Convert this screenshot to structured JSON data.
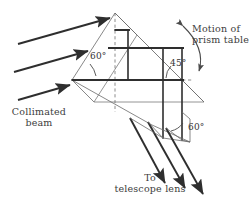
{
  "figure": {
    "type": "optics-diagram",
    "background_color": "#ffffff",
    "line_color": "#2e2e2e",
    "thin_line_color": "#6a6a6a",
    "dashed_color": "#5a5a5a",
    "text_color": "#3a3a3a"
  },
  "labels": {
    "angle_left": "60°",
    "angle_right_top": "45°",
    "angle_right_bottom": "60°",
    "collimated_line1": "Collimated",
    "collimated_line2": "beam",
    "motion_line1": "Motion  of",
    "motion_line2": "prism  table",
    "telescope_line1": "To",
    "telescope_line2": "telescope  lens"
  },
  "geometry": {
    "apex": [
      115,
      13
    ],
    "left_vertex": [
      72,
      80
    ],
    "right_vertex": [
      182,
      80
    ],
    "depth_offset": [
      22,
      22
    ],
    "incident_rays": 3,
    "exit_rays": 3,
    "internal_rays": 3
  }
}
